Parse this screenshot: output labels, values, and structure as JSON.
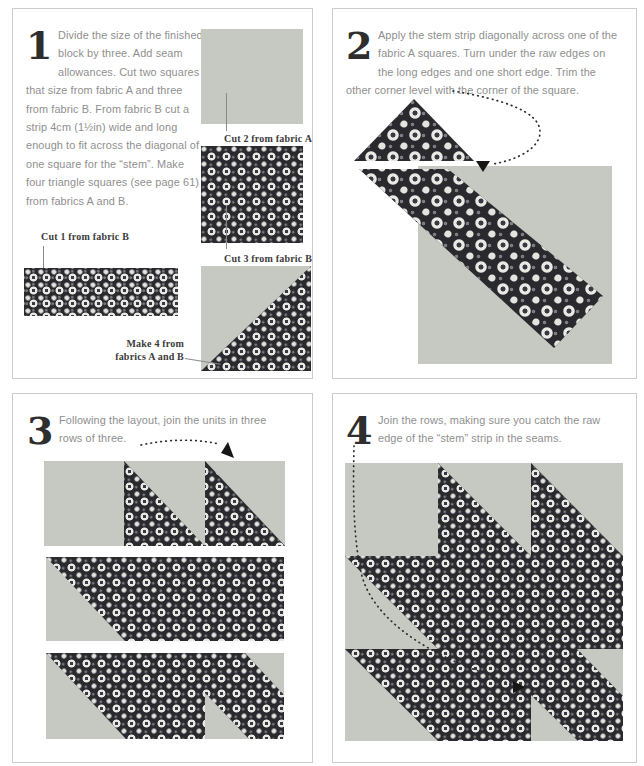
{
  "document": {
    "type": "quilt-block-instructions",
    "colors": {
      "page_bg": "#ffffff",
      "panel_border": "#cbcbcb",
      "fabric_a": "#c6c9c1",
      "fabric_b_base": "#2a292d",
      "fabric_b_motif": "#e8e8e5",
      "body_text": "#8f8f8f",
      "caption_text": "#3b3b3b",
      "numeral": "#2e2e2e",
      "arrow": "#161616"
    }
  },
  "steps": [
    {
      "number": "1",
      "text": "Divide the size of the finished block by three. Add seam allowances. Cut two squares that size from fabric A and three from fabric B. From fabric B cut a strip 4cm (1½in) wide and long enough to fit across the diagonal of one square for the “stem”. Make four triangle squares (see page 61) from fabrics A and B.",
      "captions": {
        "cut2": "Cut 2 from fabric A",
        "cut3": "Cut 3 from fabric B",
        "cut1": "Cut 1 from fabric B",
        "make4_line1": "Make 4 from",
        "make4_line2": "fabrics A and B"
      }
    },
    {
      "number": "2",
      "text": "Apply the stem strip diagonally across one of the fabric A squares. Turn under the raw edges on the long edges and one short edge. Trim the other corner level with the corner of the square."
    },
    {
      "number": "3",
      "text": "Following the layout, join the units in three rows of three."
    },
    {
      "number": "4",
      "text": "Join the rows, making sure you catch the raw edge of the “stem” strip in the seams."
    }
  ]
}
